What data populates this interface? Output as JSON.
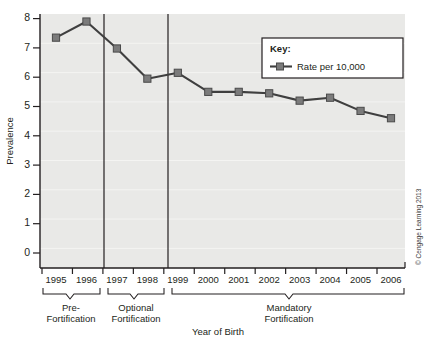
{
  "chart_data": {
    "type": "line",
    "title": "",
    "xlabel": "Year of Birth",
    "ylabel": "Prevalence",
    "categories": [
      "1995",
      "1996",
      "1997",
      "1998",
      "1999",
      "2000",
      "2001",
      "2002",
      "2003",
      "2004",
      "2005",
      "2006"
    ],
    "series": [
      {
        "name": "Rate per 10,000",
        "values": [
          7.35,
          7.9,
          6.98,
          5.95,
          6.15,
          5.5,
          5.5,
          5.45,
          5.2,
          5.3,
          4.85,
          4.6
        ]
      }
    ],
    "ylim": [
      0,
      8
    ],
    "yticks": [
      0,
      1,
      2,
      3,
      4,
      5,
      6,
      7,
      8
    ],
    "ytick_labels": [
      "0",
      "1",
      "2",
      "3",
      "4",
      "5",
      "6",
      "7",
      "8"
    ],
    "grid": true,
    "legend_position": "top-right",
    "marker": "square",
    "series_color": "#3f3f3f",
    "marker_color": "#7b7b7b",
    "plot_background": "#e9e9e7",
    "dividers": [
      {
        "after_category": "1996",
        "label": "pre-fortification-divider"
      },
      {
        "after_category": "1998",
        "label": "optional-fortification-divider"
      }
    ],
    "annotations": [
      {
        "type": "bracket",
        "line1": "Pre-",
        "line2": "Fortification",
        "from": "1995",
        "to": "1996"
      },
      {
        "type": "bracket",
        "line1": "Optional",
        "line2": "Fortification",
        "from": "1997",
        "to": "1998"
      },
      {
        "type": "bracket",
        "line1": "Mandatory",
        "line2": "Fortification",
        "from": "1999",
        "to": "2006"
      }
    ]
  },
  "legend": {
    "title": "Key:",
    "entries": [
      {
        "label": "Rate per 10,000",
        "color": "#3f3f3f"
      }
    ]
  },
  "axes": {
    "y_title": "Prevalence",
    "x_title": "Year of Birth"
  },
  "credit": {
    "text": "© Cengage Learning 2013"
  }
}
